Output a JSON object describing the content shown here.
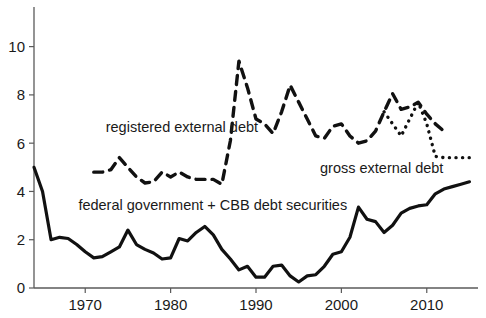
{
  "chart_data": {
    "type": "line",
    "title": "",
    "subtitle": "",
    "xlabel": "",
    "ylabel": "",
    "xlim": [
      1964,
      2016
    ],
    "ylim": [
      0,
      11.6
    ],
    "grid": false,
    "legend_position": "inline-annotations",
    "xticks": [
      1970,
      1980,
      1990,
      2000,
      2010
    ],
    "xtick_labels": [
      "1970",
      "1980",
      "1990",
      "2000",
      "2010"
    ],
    "yticks": [
      0,
      2,
      4,
      6,
      8,
      10
    ],
    "ytick_labels": [
      "0",
      "2",
      "4",
      "6",
      "8",
      "10"
    ],
    "series": [
      {
        "name": "federal government + CBB debt securities",
        "style": "solid",
        "color": "#111111",
        "width": 3.2,
        "x": [
          1964,
          1965,
          1966,
          1967,
          1968,
          1969,
          1970,
          1971,
          1972,
          1973,
          1974,
          1975,
          1976,
          1977,
          1978,
          1979,
          1980,
          1981,
          1982,
          1983,
          1984,
          1985,
          1986,
          1987,
          1988,
          1989,
          1990,
          1991,
          1992,
          1993,
          1994,
          1995,
          1996,
          1997,
          1998,
          1999,
          2000,
          2001,
          2002,
          2003,
          2004,
          2005,
          2006,
          2007,
          2008,
          2009,
          2010,
          2011,
          2012,
          2013,
          2014,
          2015
        ],
        "values": [
          5.0,
          4.0,
          2.0,
          2.1,
          2.05,
          1.8,
          1.5,
          1.25,
          1.3,
          1.5,
          1.7,
          2.4,
          1.8,
          1.6,
          1.45,
          1.2,
          1.25,
          2.05,
          1.95,
          2.3,
          2.55,
          2.2,
          1.6,
          1.2,
          0.75,
          0.9,
          0.45,
          0.45,
          0.9,
          0.95,
          0.5,
          0.25,
          0.5,
          0.55,
          0.9,
          1.4,
          1.5,
          2.1,
          3.35,
          2.85,
          2.75,
          2.3,
          2.6,
          3.1,
          3.3,
          3.4,
          3.45,
          3.9,
          4.1,
          4.2,
          4.3,
          4.4
        ]
      },
      {
        "name": "registered external debt",
        "style": "dashed",
        "color": "#111111",
        "width": 3.4,
        "x": [
          1971,
          1972,
          1973,
          1974,
          1975,
          1976,
          1977,
          1978,
          1979,
          1980,
          1981,
          1982,
          1983,
          1984,
          1985,
          1986,
          1987,
          1988,
          1989,
          1990,
          1991,
          1992,
          1993,
          1994,
          1995,
          1996,
          1997,
          1998,
          1999,
          2000,
          2001,
          2002,
          2003,
          2004,
          2005,
          2006,
          2007,
          2008,
          2009,
          2010,
          2011,
          2012
        ],
        "values": [
          4.8,
          4.8,
          4.9,
          5.4,
          5.0,
          4.6,
          4.35,
          4.4,
          4.8,
          4.6,
          4.8,
          4.6,
          4.5,
          4.5,
          4.5,
          4.3,
          6.1,
          9.4,
          8.3,
          7.0,
          6.8,
          6.4,
          7.3,
          8.4,
          7.7,
          7.0,
          6.3,
          6.2,
          6.7,
          6.8,
          6.3,
          6.0,
          6.1,
          6.5,
          7.3,
          8.05,
          7.4,
          7.5,
          7.7,
          7.2,
          6.8,
          6.5
        ]
      },
      {
        "name": "gross external debt",
        "style": "dotted",
        "color": "#111111",
        "width": 3.4,
        "x": [
          2005,
          2006,
          2007,
          2008,
          2009,
          2010,
          2011,
          2012,
          2013,
          2014,
          2015
        ],
        "values": [
          7.3,
          6.8,
          6.3,
          7.0,
          7.7,
          6.8,
          5.45,
          5.4,
          5.4,
          5.4,
          5.4
        ]
      }
    ],
    "annotations": [
      {
        "id": "registered-external-debt-label",
        "text": "registered external debt",
        "x": 1972.4,
        "y": 6.45,
        "anchor": "start"
      },
      {
        "id": "federal-government-cbb-label",
        "text": "federal government + CBB debt securities",
        "x": 1969.2,
        "y": 3.25,
        "anchor": "start"
      },
      {
        "id": "gross-external-debt-label",
        "text": "gross external debt",
        "x": 1997.5,
        "y": 4.75,
        "anchor": "start"
      }
    ]
  }
}
